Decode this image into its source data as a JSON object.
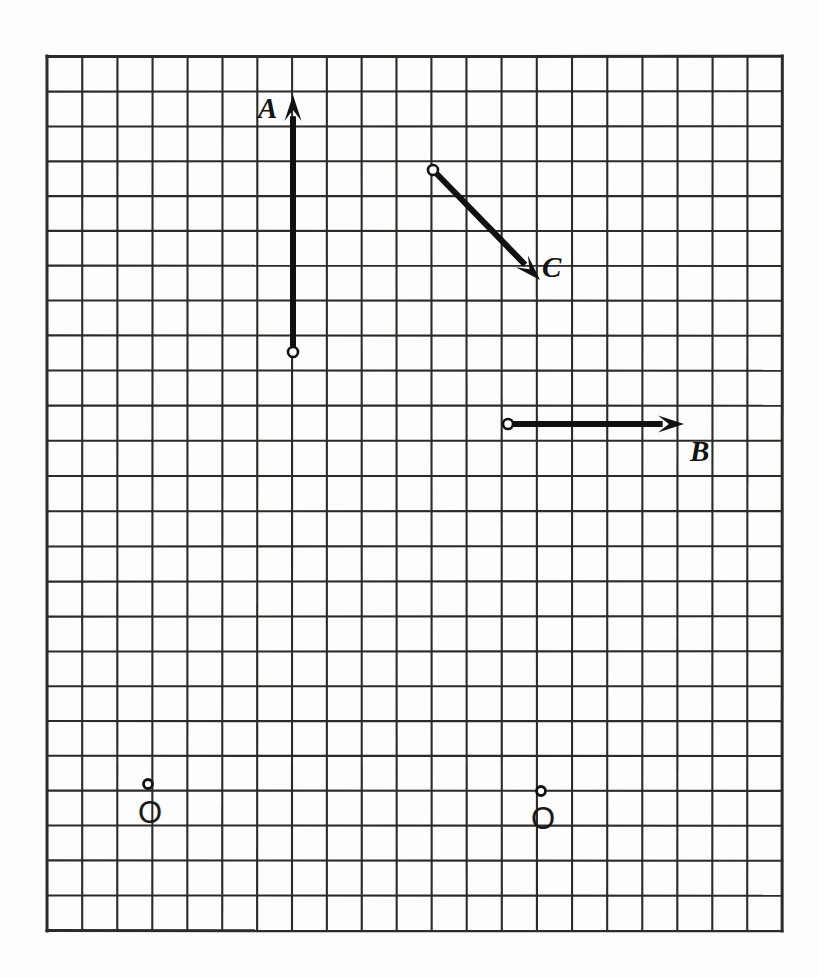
{
  "figure": {
    "background_color": "#fdfdfc",
    "width": 819,
    "height": 978
  },
  "grid": {
    "name": "square-graph-grid",
    "origin_x": 47,
    "origin_y": 56,
    "cell_size": 35,
    "columns": 21,
    "rows": 25,
    "line_color": "#2b2b2b",
    "line_width": 2.1,
    "border_width": 3.0,
    "show": true
  },
  "vectors": [
    {
      "id": "A",
      "label": "A",
      "color": "#111111",
      "shaft_width": 6,
      "tail": {
        "x": 293,
        "y": 352,
        "grid_col": 7,
        "grid_row": 8.46
      },
      "head": {
        "x": 293,
        "y": 95,
        "grid_col": 7,
        "grid_row": 1.11
      },
      "components": {
        "dx": 0,
        "dy": 7.35
      },
      "direction": "up",
      "label_pos": {
        "x": 268,
        "y": 110
      }
    },
    {
      "id": "B",
      "label": "B",
      "color": "#111111",
      "shaft_width": 6,
      "tail": {
        "x": 508,
        "y": 424,
        "grid_col": 13.17,
        "grid_row": 10.51
      },
      "head": {
        "x": 684,
        "y": 424,
        "grid_col": 18.2,
        "grid_row": 10.51
      },
      "components": {
        "dx": 5.03,
        "dy": 0
      },
      "direction": "right",
      "label_pos": {
        "x": 700,
        "y": 452
      }
    },
    {
      "id": "C",
      "label": "C",
      "color": "#111111",
      "shaft_width": 6,
      "tail": {
        "x": 433,
        "y": 170,
        "grid_col": 11.03,
        "grid_row": 3.26
      },
      "head": {
        "x": 540,
        "y": 280,
        "grid_col": 14.09,
        "grid_row": 6.4
      },
      "components": {
        "dx": 3.06,
        "dy": -3.14
      },
      "direction": "down-right",
      "label_pos": {
        "x": 552,
        "y": 268
      }
    }
  ],
  "origins": [
    {
      "id": "origin-left",
      "label": "O",
      "dot": {
        "x": 148,
        "y": 784,
        "radius": 4.5
      },
      "label_pos": {
        "x": 148,
        "y": 812
      },
      "tick_marks": {
        "horizontal": true,
        "vertical": true
      }
    },
    {
      "id": "origin-right",
      "label": "O",
      "dot": {
        "x": 541,
        "y": 791,
        "radius": 4.5
      },
      "label_pos": {
        "x": 541,
        "y": 818
      },
      "tick_marks": {
        "horizontal": true,
        "vertical": true
      }
    }
  ],
  "markers": {
    "tail_dot_radius": 5,
    "tail_dot_stroke": 2.6,
    "tail_dot_fill": "#fdfdfc",
    "tail_dot_color": "#111111"
  },
  "chart_data": {
    "type": "scatter",
    "xlabel": "",
    "ylabel": "",
    "grid": true,
    "legend": "none",
    "series": [
      {
        "name": "A",
        "kind": "vector-arrow",
        "tail_cell": [
          7,
          8.46
        ],
        "head_cell": [
          7,
          1.11
        ],
        "components_cells": [
          0,
          7.35
        ],
        "magnitude_cells": 7.35,
        "angle_deg": 90
      },
      {
        "name": "B",
        "kind": "vector-arrow",
        "tail_cell": [
          13.17,
          10.51
        ],
        "head_cell": [
          18.2,
          10.51
        ],
        "components_cells": [
          5.03,
          0
        ],
        "magnitude_cells": 5.03,
        "angle_deg": 0
      },
      {
        "name": "C",
        "kind": "vector-arrow",
        "tail_cell": [
          11.03,
          3.26
        ],
        "head_cell": [
          14.09,
          6.4
        ],
        "components_cells": [
          3.06,
          -3.14
        ],
        "magnitude_cells": 4.38,
        "angle_deg": -45.7
      }
    ],
    "annotations": [
      "A",
      "B",
      "C",
      "O",
      "O"
    ]
  }
}
